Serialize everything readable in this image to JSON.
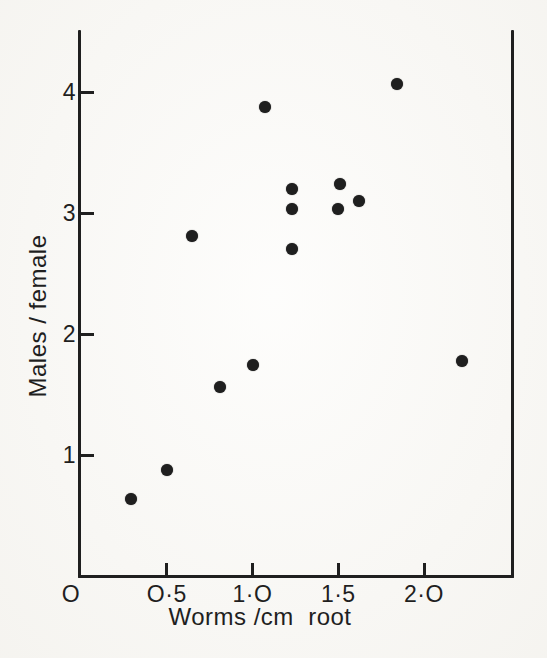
{
  "figure": {
    "ink_color": "#1f1f1f",
    "paper_color": "#fbfaf7"
  },
  "chart_data": {
    "type": "scatter",
    "title": "",
    "xlabel": "Worms /cm  root",
    "ylabel": "Males / female",
    "origin_label": "O",
    "xlim": [
      0,
      2.51
    ],
    "ylim": [
      0,
      4.51
    ],
    "grid": false,
    "legend": false,
    "marker": "filled-circle",
    "x_ticks": [
      {
        "value": 0.5,
        "label": "O·5"
      },
      {
        "value": 1.0,
        "label": "1·O"
      },
      {
        "value": 1.5,
        "label": "1·5"
      },
      {
        "value": 2.0,
        "label": "2·O"
      }
    ],
    "y_ticks": [
      {
        "value": 1,
        "label": "1"
      },
      {
        "value": 2,
        "label": "2"
      },
      {
        "value": 3,
        "label": "3"
      },
      {
        "value": 4,
        "label": "4"
      }
    ],
    "points": [
      {
        "x": 0.29,
        "y": 0.64
      },
      {
        "x": 0.5,
        "y": 0.88
      },
      {
        "x": 0.65,
        "y": 2.81
      },
      {
        "x": 0.81,
        "y": 1.56
      },
      {
        "x": 1.0,
        "y": 1.74
      },
      {
        "x": 1.07,
        "y": 3.88
      },
      {
        "x": 1.23,
        "y": 3.2
      },
      {
        "x": 1.23,
        "y": 3.03
      },
      {
        "x": 1.23,
        "y": 2.7
      },
      {
        "x": 1.5,
        "y": 3.03
      },
      {
        "x": 1.51,
        "y": 3.24
      },
      {
        "x": 1.62,
        "y": 3.1
      },
      {
        "x": 1.84,
        "y": 4.07
      },
      {
        "x": 2.22,
        "y": 1.78
      }
    ]
  }
}
